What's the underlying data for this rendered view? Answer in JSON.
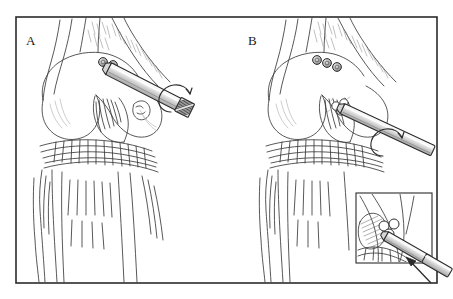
{
  "figure": {
    "type": "medical-line-illustration",
    "background_color": "#ffffff",
    "ink_color": "#2b2b2b",
    "shade_color": "#9a9a9a",
    "frame": {
      "name": "outer-border",
      "x": 16,
      "y": 17,
      "width": 421,
      "height": 266,
      "stroke": "#2b2b2b",
      "stroke_width": 1.6
    },
    "panels": [
      {
        "id": "A",
        "label": "A",
        "label_x": 26,
        "label_y": 45,
        "description": "Anterior view of flexed knee with drill entering lateral femoral condyle; two round markers above drill entry; rotation arrow at drill shaft",
        "marker_count": 2,
        "drill": {
          "name": "drill-instrument-a",
          "angle_deg": 27,
          "rotation_arrow": true,
          "tip_hatched": true
        }
      },
      {
        "id": "B",
        "label": "B",
        "label_x": 248,
        "label_y": 45,
        "description": "Same knee with drill advanced through intercondylar notch; three round markers; cluster of small circles at tunnel aperture; rotation arrow at shaft",
        "marker_count": 3,
        "drill": {
          "name": "drill-instrument-b",
          "angle_deg": 25,
          "rotation_arrow": true,
          "tip_hatched": false
        },
        "inset": {
          "name": "magnified-inset-box",
          "x": 356,
          "y": 193,
          "width": 76,
          "height": 70,
          "stroke": "#2b2b2b",
          "stroke_width": 1.1,
          "description": "Close-up of notch showing drill tip and three graft circles",
          "arrow": {
            "name": "direction-arrow",
            "points_toward": "up-left",
            "filled_head": true
          }
        }
      }
    ]
  }
}
